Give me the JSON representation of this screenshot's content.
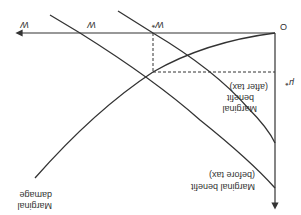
{
  "diagram": {
    "orientation": "rotated 180 degrees",
    "colors": {
      "line": "#333333",
      "background": "#ffffff"
    },
    "axes": {
      "origin_label": "O",
      "x_axis_label": "W",
      "y_axis_label": "μ"
    },
    "points": {
      "w_star": "W*",
      "w_hat": "W",
      "mu_star": "μ*"
    },
    "curves": {
      "marginal_damage": [
        "Marginal",
        "damage"
      ],
      "mb_after_tax": [
        "Marginal",
        "benefit",
        "(after tax)"
      ],
      "mb_before_tax": [
        "Marginal benefit",
        "(before tax)"
      ]
    }
  }
}
